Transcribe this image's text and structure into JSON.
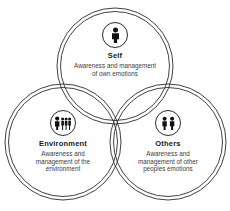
{
  "diagram": {
    "stroke_color": "#2b2b2b",
    "background_color": "#ffffff",
    "text_color": "#1a1a1a",
    "description_color": "#3c3c3c",
    "nodes": [
      {
        "id": "self",
        "title": "Self",
        "description": "Awareness and management of own emotions",
        "icon": "single-person-icon",
        "position": "top"
      },
      {
        "id": "environment",
        "title": "Environment",
        "description": "Awareness and management of the environment",
        "icon": "group-of-people-icon",
        "position": "bottom-left"
      },
      {
        "id": "others",
        "title": "Others",
        "description": "Awareness and management of other peoples emotions",
        "icon": "two-people-icon",
        "position": "bottom-right"
      }
    ]
  }
}
